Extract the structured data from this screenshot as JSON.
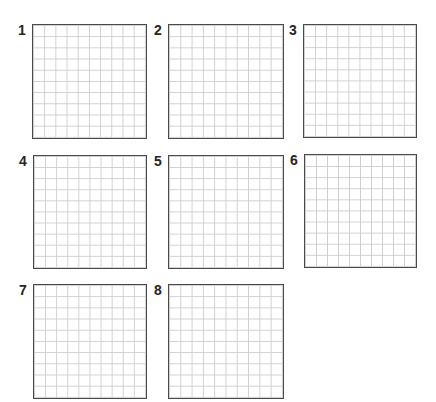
{
  "grid_rows": 10,
  "grid_cols": 10,
  "colors": {
    "border": "#4a4a4a",
    "gridline": "#cfcfcf",
    "label": "#262626",
    "background": "#ffffff"
  },
  "panels": [
    {
      "label": "1",
      "x": 32,
      "y": 24,
      "w": 115,
      "h": 115
    },
    {
      "label": "2",
      "x": 168,
      "y": 24,
      "w": 116,
      "h": 115
    },
    {
      "label": "3",
      "x": 303,
      "y": 24,
      "w": 114,
      "h": 114
    },
    {
      "label": "4",
      "x": 33,
      "y": 155,
      "w": 114,
      "h": 114
    },
    {
      "label": "5",
      "x": 168,
      "y": 155,
      "w": 116,
      "h": 114
    },
    {
      "label": "6",
      "x": 304,
      "y": 154,
      "w": 113,
      "h": 114
    },
    {
      "label": "7",
      "x": 33,
      "y": 284,
      "w": 114,
      "h": 115
    },
    {
      "label": "8",
      "x": 168,
      "y": 284,
      "w": 116,
      "h": 115
    }
  ]
}
